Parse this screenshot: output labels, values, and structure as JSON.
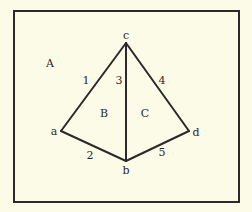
{
  "diagram": {
    "type": "planar-graph",
    "background_color": "#fcfbe8",
    "line_color": "#2a2a2a",
    "frame": {
      "x": 14,
      "y": 11,
      "width": 225,
      "height": 191
    },
    "vertices": [
      {
        "id": "a",
        "label": "a",
        "x": 61,
        "y": 131,
        "label_x": 54,
        "label_y": 135
      },
      {
        "id": "b",
        "label": "b",
        "x": 126,
        "y": 161,
        "label_x": 126,
        "label_y": 174
      },
      {
        "id": "c",
        "label": "c",
        "x": 126,
        "y": 43,
        "label_x": 126,
        "label_y": 39
      },
      {
        "id": "d",
        "label": "d",
        "x": 189,
        "y": 131,
        "label_x": 196,
        "label_y": 136
      }
    ],
    "edges": [
      {
        "id": "1",
        "label": "1",
        "from": "a",
        "to": "c",
        "label_x": 86,
        "label_y": 84
      },
      {
        "id": "2",
        "label": "2",
        "from": "a",
        "to": "b",
        "label_x": 90,
        "label_y": 159
      },
      {
        "id": "3",
        "label": "3",
        "from": "b",
        "to": "c",
        "label_x": 119,
        "label_y": 84
      },
      {
        "id": "4",
        "label": "4",
        "from": "c",
        "to": "d",
        "label_x": 162,
        "label_y": 84
      },
      {
        "id": "5",
        "label": "5",
        "from": "b",
        "to": "d",
        "label_x": 162,
        "label_y": 156
      }
    ],
    "faces": [
      {
        "id": "A",
        "label": "A",
        "label_x": 50,
        "label_y": 67
      },
      {
        "id": "B",
        "label": "B",
        "label_x": 104,
        "label_y": 117
      },
      {
        "id": "C",
        "label": "C",
        "label_x": 145,
        "label_y": 117
      }
    ]
  }
}
